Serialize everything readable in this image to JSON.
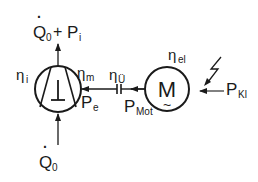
{
  "diagram": {
    "type": "energy-flow schematic (compressor driven by electric motor)",
    "top_output": {
      "main": "Q",
      "dot": "·",
      "sub": "0",
      "plus": "+",
      "p": "P",
      "p_sub": "i"
    },
    "bottom_input": {
      "main": "Q",
      "dot": "·",
      "sub": "0"
    },
    "compressor": {
      "symbol": "compressor-circle",
      "efficiency_left": {
        "eta": "η",
        "sub": "i"
      },
      "efficiency_right": {
        "eta": "η",
        "sub": "m"
      },
      "power_in": {
        "p": "P",
        "sub": "e"
      }
    },
    "coupling": {
      "efficiency": {
        "eta": "η",
        "sub": "Ü"
      }
    },
    "motor": {
      "letter": "M",
      "tilde": "~",
      "efficiency": {
        "eta": "η",
        "sub": "el"
      },
      "power_out": {
        "p": "P",
        "sub": "Mot"
      }
    },
    "supply": {
      "power_in": {
        "p": "P",
        "sub": "Kl"
      },
      "symbol": "lightning-bolt"
    },
    "colors": {
      "ink": "#1a1a1a",
      "background": "#ffffff"
    }
  }
}
